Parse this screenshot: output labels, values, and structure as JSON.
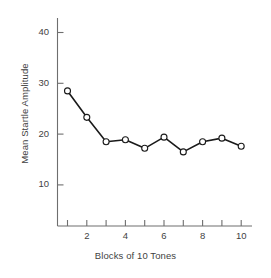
{
  "chart_data": {
    "type": "line",
    "title": "",
    "xlabel": "Blocks of 10 Tones",
    "ylabel": "Mean Startle Amplitude",
    "x": [
      1,
      2,
      3,
      4,
      5,
      6,
      7,
      8,
      9,
      10
    ],
    "values": [
      28.5,
      23.3,
      18.5,
      18.9,
      17.2,
      19.4,
      16.5,
      18.5,
      19.2,
      17.6
    ],
    "series": [
      {
        "name": "Mean Startle Amplitude",
        "values": [
          28.5,
          23.3,
          18.5,
          18.9,
          17.2,
          19.4,
          16.5,
          18.5,
          19.2,
          17.6
        ]
      }
    ],
    "xlim": [
      0.4,
      10.6
    ],
    "ylim": [
      0,
      44
    ],
    "x_ticks": [
      1,
      2,
      3,
      4,
      5,
      6,
      7,
      8,
      9,
      10
    ],
    "x_tick_labels": [
      "",
      "2",
      "",
      "4",
      "",
      "6",
      "",
      "8",
      "",
      "10"
    ],
    "y_ticks": [
      10,
      20,
      30,
      40
    ],
    "y_tick_labels": [
      "10",
      "20",
      "30",
      "40"
    ],
    "grid": false,
    "legend": false,
    "marker": "open-circle",
    "line_color": "#1a1a1a",
    "marker_face_color": "#ffffff",
    "marker_edge_color": "#1a1a1a",
    "axis_color": "#6e6e6e"
  }
}
